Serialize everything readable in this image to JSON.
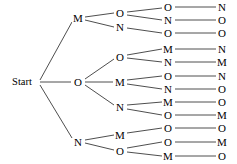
{
  "diagram": {
    "type": "tree",
    "width": 237,
    "height": 164,
    "colors": {
      "background": "#ffffff",
      "edge": "#3a3a3a",
      "text": "#000000"
    },
    "root": {
      "id": "root",
      "label": "Start",
      "x": 22,
      "y": 82
    },
    "levels": [
      {
        "level": 1,
        "x": 78,
        "nodes": [
          {
            "id": "L1-0",
            "label": "M",
            "x": 78,
            "y": 18
          },
          {
            "id": "L1-1",
            "label": "O",
            "x": 78,
            "y": 82
          },
          {
            "id": "L1-2",
            "label": "N",
            "x": 78,
            "y": 142
          }
        ]
      },
      {
        "level": 2,
        "x": 120,
        "nodes": [
          {
            "id": "L2-0",
            "label": "O",
            "x": 120,
            "y": 13
          },
          {
            "id": "L2-1",
            "label": "N",
            "x": 120,
            "y": 27
          },
          {
            "id": "L2-2",
            "label": "O",
            "x": 120,
            "y": 57
          },
          {
            "id": "L2-3",
            "label": "M",
            "x": 120,
            "y": 82
          },
          {
            "id": "L2-4",
            "label": "N",
            "x": 120,
            "y": 107
          },
          {
            "id": "L2-5",
            "label": "M",
            "x": 120,
            "y": 135
          },
          {
            "id": "L2-6",
            "label": "O",
            "x": 120,
            "y": 151
          }
        ]
      },
      {
        "level": 3,
        "x": 168,
        "nodes": [
          {
            "id": "L3-0",
            "label": "O",
            "x": 168,
            "y": 7
          },
          {
            "id": "L3-1",
            "label": "N",
            "x": 168,
            "y": 20
          },
          {
            "id": "L3-2",
            "label": "O",
            "x": 168,
            "y": 33
          },
          {
            "id": "L3-3",
            "label": "M",
            "x": 168,
            "y": 49
          },
          {
            "id": "L3-4",
            "label": "N",
            "x": 168,
            "y": 62
          },
          {
            "id": "L3-5",
            "label": "O",
            "x": 168,
            "y": 76
          },
          {
            "id": "L3-6",
            "label": "N",
            "x": 168,
            "y": 89
          },
          {
            "id": "L3-7",
            "label": "M",
            "x": 168,
            "y": 102
          },
          {
            "id": "L3-8",
            "label": "O",
            "x": 168,
            "y": 115
          },
          {
            "id": "L3-9",
            "label": "O",
            "x": 168,
            "y": 128
          },
          {
            "id": "L3-10",
            "label": "O",
            "x": 168,
            "y": 142
          },
          {
            "id": "L3-11",
            "label": "M",
            "x": 168,
            "y": 156
          }
        ]
      },
      {
        "level": 4,
        "x": 222,
        "nodes": [
          {
            "id": "L4-0",
            "label": "N",
            "x": 222,
            "y": 7
          },
          {
            "id": "L4-1",
            "label": "O",
            "x": 222,
            "y": 20
          },
          {
            "id": "L4-2",
            "label": "O",
            "x": 222,
            "y": 33
          },
          {
            "id": "L4-3",
            "label": "N",
            "x": 222,
            "y": 49
          },
          {
            "id": "L4-4",
            "label": "M",
            "x": 222,
            "y": 62
          },
          {
            "id": "L4-5",
            "label": "N",
            "x": 222,
            "y": 76
          },
          {
            "id": "L4-6",
            "label": "O",
            "x": 222,
            "y": 89
          },
          {
            "id": "L4-7",
            "label": "O",
            "x": 222,
            "y": 102
          },
          {
            "id": "L4-8",
            "label": "M",
            "x": 222,
            "y": 115
          },
          {
            "id": "L4-9",
            "label": "O",
            "x": 222,
            "y": 128
          },
          {
            "id": "L4-10",
            "label": "M",
            "x": 222,
            "y": 142
          },
          {
            "id": "L4-11",
            "label": "O",
            "x": 222,
            "y": 156
          }
        ]
      }
    ],
    "edges": [
      {
        "from": "root",
        "to": "L1-0",
        "x1": 40,
        "y1": 80,
        "x2": 72,
        "y2": 22
      },
      {
        "from": "root",
        "to": "L1-1",
        "x1": 40,
        "y1": 82,
        "x2": 71,
        "y2": 82
      },
      {
        "from": "root",
        "to": "L1-2",
        "x1": 40,
        "y1": 85,
        "x2": 72,
        "y2": 138
      },
      {
        "from": "L1-0",
        "to": "L2-0",
        "x1": 85,
        "y1": 17,
        "x2": 114,
        "y2": 13
      },
      {
        "from": "L1-0",
        "to": "L2-1",
        "x1": 85,
        "y1": 20,
        "x2": 114,
        "y2": 27
      },
      {
        "from": "L1-1",
        "to": "L2-2",
        "x1": 85,
        "y1": 79,
        "x2": 114,
        "y2": 59
      },
      {
        "from": "L1-1",
        "to": "L2-3",
        "x1": 85,
        "y1": 82,
        "x2": 113,
        "y2": 82
      },
      {
        "from": "L1-1",
        "to": "L2-4",
        "x1": 85,
        "y1": 85,
        "x2": 114,
        "y2": 105
      },
      {
        "from": "L1-2",
        "to": "L2-5",
        "x1": 85,
        "y1": 140,
        "x2": 114,
        "y2": 135
      },
      {
        "from": "L1-2",
        "to": "L2-6",
        "x1": 85,
        "y1": 143,
        "x2": 114,
        "y2": 150
      },
      {
        "from": "L2-0",
        "to": "L3-0",
        "x1": 127,
        "y1": 12,
        "x2": 162,
        "y2": 8
      },
      {
        "from": "L2-0",
        "to": "L3-1",
        "x1": 127,
        "y1": 15,
        "x2": 162,
        "y2": 20
      },
      {
        "from": "L2-1",
        "to": "L3-2",
        "x1": 127,
        "y1": 28,
        "x2": 162,
        "y2": 33
      },
      {
        "from": "L2-2",
        "to": "L3-3",
        "x1": 127,
        "y1": 55,
        "x2": 162,
        "y2": 49
      },
      {
        "from": "L2-2",
        "to": "L3-4",
        "x1": 127,
        "y1": 58,
        "x2": 162,
        "y2": 62
      },
      {
        "from": "L2-3",
        "to": "L3-5",
        "x1": 127,
        "y1": 80,
        "x2": 162,
        "y2": 76
      },
      {
        "from": "L2-3",
        "to": "L3-6",
        "x1": 127,
        "y1": 84,
        "x2": 162,
        "y2": 89
      },
      {
        "from": "L2-4",
        "to": "L3-7",
        "x1": 127,
        "y1": 105,
        "x2": 162,
        "y2": 102
      },
      {
        "from": "L2-4",
        "to": "L3-8",
        "x1": 127,
        "y1": 109,
        "x2": 162,
        "y2": 115
      },
      {
        "from": "L2-5",
        "to": "L3-9",
        "x1": 127,
        "y1": 133,
        "x2": 162,
        "y2": 128
      },
      {
        "from": "L2-6",
        "to": "L3-10",
        "x1": 127,
        "y1": 148,
        "x2": 162,
        "y2": 142
      },
      {
        "from": "L2-6",
        "to": "L3-11",
        "x1": 127,
        "y1": 152,
        "x2": 162,
        "y2": 156
      },
      {
        "from": "L3-0",
        "to": "L4-0",
        "x1": 175,
        "y1": 7,
        "x2": 216,
        "y2": 7
      },
      {
        "from": "L3-1",
        "to": "L4-1",
        "x1": 175,
        "y1": 20,
        "x2": 216,
        "y2": 20
      },
      {
        "from": "L3-2",
        "to": "L4-2",
        "x1": 175,
        "y1": 33,
        "x2": 216,
        "y2": 33
      },
      {
        "from": "L3-3",
        "to": "L4-3",
        "x1": 175,
        "y1": 49,
        "x2": 216,
        "y2": 49
      },
      {
        "from": "L3-4",
        "to": "L4-4",
        "x1": 175,
        "y1": 62,
        "x2": 216,
        "y2": 62
      },
      {
        "from": "L3-5",
        "to": "L4-5",
        "x1": 175,
        "y1": 76,
        "x2": 216,
        "y2": 76
      },
      {
        "from": "L3-6",
        "to": "L4-6",
        "x1": 175,
        "y1": 89,
        "x2": 216,
        "y2": 89
      },
      {
        "from": "L3-7",
        "to": "L4-7",
        "x1": 175,
        "y1": 102,
        "x2": 216,
        "y2": 102
      },
      {
        "from": "L3-8",
        "to": "L4-8",
        "x1": 175,
        "y1": 115,
        "x2": 216,
        "y2": 115
      },
      {
        "from": "L3-9",
        "to": "L4-9",
        "x1": 175,
        "y1": 128,
        "x2": 216,
        "y2": 128
      },
      {
        "from": "L3-10",
        "to": "L4-10",
        "x1": 175,
        "y1": 142,
        "x2": 216,
        "y2": 142
      },
      {
        "from": "L3-11",
        "to": "L4-11",
        "x1": 175,
        "y1": 156,
        "x2": 216,
        "y2": 156
      }
    ],
    "paths": [
      [
        "Start",
        "M",
        "O",
        "O",
        "N"
      ],
      [
        "Start",
        "M",
        "O",
        "N",
        "O"
      ],
      [
        "Start",
        "M",
        "N",
        "O",
        "O"
      ],
      [
        "Start",
        "O",
        "O",
        "M",
        "N"
      ],
      [
        "Start",
        "O",
        "O",
        "N",
        "M"
      ],
      [
        "Start",
        "O",
        "M",
        "O",
        "N"
      ],
      [
        "Start",
        "O",
        "M",
        "N",
        "O"
      ],
      [
        "Start",
        "O",
        "N",
        "M",
        "O"
      ],
      [
        "Start",
        "O",
        "N",
        "O",
        "M"
      ],
      [
        "Start",
        "N",
        "M",
        "O",
        "O"
      ],
      [
        "Start",
        "N",
        "O",
        "O",
        "M"
      ],
      [
        "Start",
        "N",
        "O",
        "M",
        "O"
      ]
    ]
  }
}
